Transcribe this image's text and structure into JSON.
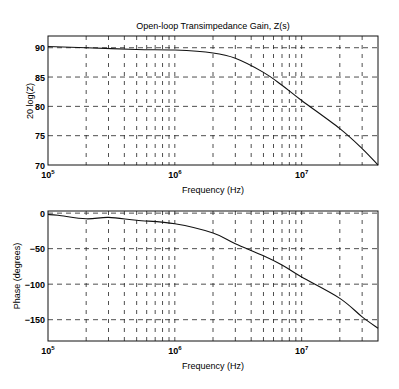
{
  "chart_data": [
    {
      "type": "line",
      "title": "Open-loop Transimpedance Gain, Z(s)",
      "xlabel": "Frequency (Hz)",
      "ylabel": "20 log(Z)",
      "xscale": "log",
      "xlim": [
        100000,
        40000000
      ],
      "ylim": [
        70,
        92
      ],
      "xticks": [
        "10^5",
        "10^6",
        "10^7"
      ],
      "yticks": [
        70,
        75,
        80,
        85,
        90
      ],
      "grid": true,
      "legend": null,
      "series": [
        {
          "name": "Gain",
          "x": [
            100000,
            200000,
            500000,
            1000000,
            2000000,
            3000000,
            5000000,
            7000000,
            10000000,
            20000000,
            30000000,
            40000000
          ],
          "values": [
            90.2,
            90.0,
            89.7,
            89.6,
            89.1,
            88.2,
            85.8,
            83.6,
            81.0,
            76.2,
            72.8,
            70.0
          ]
        }
      ]
    },
    {
      "type": "line",
      "title": "",
      "xlabel": "Frequency (Hz)",
      "ylabel": "Phase (degrees)",
      "xscale": "log",
      "xlim": [
        100000,
        40000000
      ],
      "ylim": [
        -180,
        3
      ],
      "xticks": [
        "10^5",
        "10^6",
        "10^7"
      ],
      "yticks": [
        -150,
        -100,
        -50,
        0
      ],
      "grid": true,
      "legend": null,
      "series": [
        {
          "name": "Phase",
          "x": [
            100000,
            120000,
            200000,
            300000,
            500000,
            1000000,
            2000000,
            3000000,
            5000000,
            7000000,
            10000000,
            20000000,
            30000000,
            40000000
          ],
          "values": [
            -2,
            -3,
            -8,
            -6,
            -10,
            -15,
            -28,
            -43,
            -60,
            -73,
            -90,
            -120,
            -146,
            -162
          ]
        }
      ]
    }
  ],
  "labels": {
    "top_title": "Open-loop Transimpedance Gain, Z(s)",
    "top_ylabel": "20 log(Z)",
    "top_xlabel": "Frequency (Hz)",
    "bottom_ylabel": "Phase (degrees)",
    "bottom_xlabel": "Frequency (Hz)",
    "x_tick_base": "10",
    "x_tick_exps": [
      "5",
      "6",
      "7"
    ],
    "top_yticks": [
      "90",
      "85",
      "80",
      "75",
      "70"
    ],
    "bottom_yticks": [
      "0",
      "-50",
      "-100",
      "-150"
    ]
  }
}
